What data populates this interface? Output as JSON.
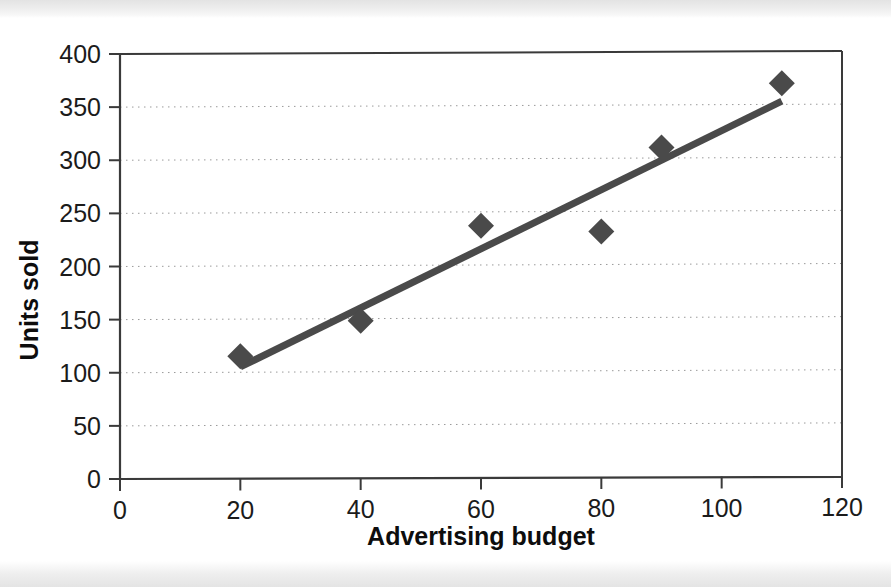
{
  "figure": {
    "background_color": "#ffffff",
    "plot_area_border_color": "#3a3a3a",
    "gridline_color": "#9a9a9a",
    "marker_color": "#4a4a4a",
    "trendline_color": "#4a4a4a"
  },
  "chart_data": {
    "type": "scatter",
    "title": "",
    "subtitle": "",
    "xlabel": "Advertising budget",
    "ylabel": "Units sold",
    "xlim": [
      0,
      120
    ],
    "ylim": [
      0,
      400
    ],
    "xticks": [
      "0",
      "20",
      "40",
      "60",
      "80",
      "100",
      "120"
    ],
    "xtick_values": [
      0,
      20,
      40,
      60,
      80,
      100,
      120
    ],
    "yticks": [
      "0",
      "50",
      "100",
      "150",
      "200",
      "250",
      "300",
      "350",
      "400"
    ],
    "ytick_values": [
      0,
      50,
      100,
      150,
      200,
      250,
      300,
      350,
      400
    ],
    "grid": "horizontal-dotted",
    "legend": "none",
    "series": [
      {
        "name": "Units sold",
        "marker": "diamond",
        "points": [
          {
            "x": 20,
            "y": 115
          },
          {
            "x": 40,
            "y": 148
          },
          {
            "x": 60,
            "y": 237
          },
          {
            "x": 80,
            "y": 231
          },
          {
            "x": 90,
            "y": 310
          },
          {
            "x": 110,
            "y": 370
          }
        ]
      },
      {
        "name": "Linear trendline",
        "marker": "none",
        "line": {
          "x1": 20,
          "y1": 105,
          "x2": 110,
          "y2": 353
        }
      }
    ],
    "annotations": []
  }
}
